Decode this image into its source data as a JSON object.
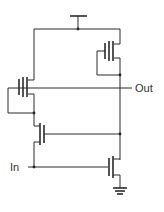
{
  "diagram": {
    "type": "transistor-schematic",
    "labels": {
      "output": "Out",
      "input": "In"
    },
    "components": [
      {
        "id": "vdd",
        "kind": "supply"
      },
      {
        "id": "m1",
        "kind": "pmos",
        "role": "load (top-right)"
      },
      {
        "id": "m2",
        "kind": "pmos",
        "role": "left upper"
      },
      {
        "id": "m3",
        "kind": "nmos",
        "role": "left lower"
      },
      {
        "id": "m4",
        "kind": "nmos",
        "role": "input driver (bottom-right)"
      },
      {
        "id": "gnd",
        "kind": "ground"
      }
    ],
    "colors": {
      "wire": "#2a2a2a",
      "background": "#ffffff"
    }
  }
}
